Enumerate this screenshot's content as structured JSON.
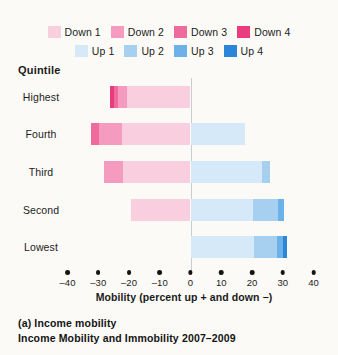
{
  "legend": {
    "rows": [
      {
        "items": [
          {
            "label": "Down 1",
            "color": "#f9cfdf"
          },
          {
            "label": "Down 2",
            "color": "#f49bbf"
          },
          {
            "label": "Down 3",
            "color": "#ef6a9d"
          },
          {
            "label": "Down 4",
            "color": "#e93c7c"
          }
        ]
      },
      {
        "items": [
          {
            "label": "Up 1",
            "color": "#d6e9f9"
          },
          {
            "label": "Up 2",
            "color": "#a6cff0"
          },
          {
            "label": "Up 3",
            "color": "#6cb2e8"
          },
          {
            "label": "Up 4",
            "color": "#2b86d9"
          }
        ]
      }
    ]
  },
  "plot": {
    "quintile_header": "Quintile",
    "rows": [
      "Highest",
      "Fourth",
      "Third",
      "Second",
      "Lowest"
    ]
  },
  "axis": {
    "title": "Mobility (percent up + and down −)",
    "ticks": [
      "–40",
      "–30",
      "–20",
      "–10",
      "0",
      "10",
      "20",
      "30",
      "40"
    ]
  },
  "caption": {
    "line1": "(a) Income mobility",
    "line2": "Income Mobility and Immobility 2007–2009"
  },
  "chart_data": {
    "type": "bar",
    "orientation": "horizontal",
    "stacked": true,
    "diverging": true,
    "title": "Income Mobility and Immobility 2007–2009",
    "subtitle": "(a) Income mobility",
    "xlabel": "Mobility (percent up + and down −)",
    "ylabel": "Quintile",
    "xlim": [
      -40,
      40
    ],
    "xticks": [
      -40,
      -30,
      -20,
      -10,
      0,
      10,
      20,
      30,
      40
    ],
    "grid": false,
    "legend_position": "top",
    "categories": [
      "Highest",
      "Fourth",
      "Third",
      "Second",
      "Lowest"
    ],
    "series": [
      {
        "name": "Down 1",
        "color": "#f9cfdf",
        "direction": "down",
        "values": [
          -20.8,
          -22.4,
          -21.8,
          -19.5,
          0
        ]
      },
      {
        "name": "Down 2",
        "color": "#f49bbf",
        "direction": "down",
        "values": [
          -2.9,
          -7.5,
          -6.2,
          0,
          0
        ]
      },
      {
        "name": "Down 3",
        "color": "#ef6a9d",
        "direction": "down",
        "values": [
          -1.3,
          -2.3,
          0,
          0,
          0
        ]
      },
      {
        "name": "Down 4",
        "color": "#e93c7c",
        "direction": "down",
        "values": [
          -1.3,
          0,
          0,
          0,
          0
        ]
      },
      {
        "name": "Up 1",
        "color": "#d6e9f9",
        "direction": "up",
        "values": [
          0,
          17.6,
          23.4,
          20.2,
          20.8
        ]
      },
      {
        "name": "Up 2",
        "color": "#a6cff0",
        "direction": "up",
        "values": [
          0,
          0,
          2.3,
          8.1,
          7.2
        ]
      },
      {
        "name": "Up 3",
        "color": "#6cb2e8",
        "direction": "up",
        "values": [
          0,
          0,
          0,
          2.0,
          2.0
        ]
      },
      {
        "name": "Up 4",
        "color": "#2b86d9",
        "direction": "up",
        "values": [
          0,
          0,
          0,
          0,
          1.3
        ]
      }
    ],
    "totals_down": [
      -26.3,
      -32.2,
      -28.0,
      -19.5,
      0
    ],
    "totals_up": [
      0,
      17.6,
      25.7,
      30.3,
      31.3
    ]
  }
}
